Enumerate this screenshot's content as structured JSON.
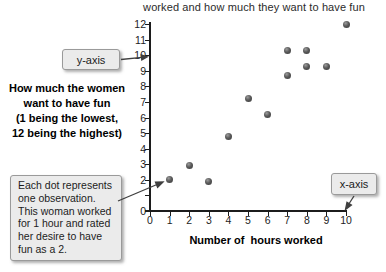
{
  "figure": {
    "title_line": "worked and how much they want to have fun",
    "y_axis_label_lines": [
      "How much the women",
      "want to have fun",
      "(1 being the lowest,",
      "12 being the highest)"
    ],
    "x_axis_label": "Number of  hours worked",
    "callout_y_axis": "y-axis",
    "callout_x_axis": "x-axis",
    "callout_observation": "Each dot represents\none observation.\nThis woman worked\nfor 1 hour and rated\nher desire to have\nfun as a 2."
  },
  "chart_data": {
    "type": "scatter",
    "title": "worked and how much they want to have fun",
    "xlabel": "Number of hours worked",
    "ylabel": "How much the women want to have fun (1 being the lowest, 12 being the highest)",
    "xlim": [
      0,
      10
    ],
    "ylim": [
      0,
      12
    ],
    "x_ticks": [
      0,
      1,
      2,
      3,
      4,
      5,
      6,
      7,
      8,
      9,
      10
    ],
    "y_ticks": [
      0,
      1,
      2,
      3,
      4,
      5,
      6,
      7,
      8,
      9,
      10,
      11,
      12
    ],
    "y_tick_labels_hidden": [
      1
    ],
    "grid": false,
    "legend": false,
    "points": [
      [
        1,
        2
      ],
      [
        2,
        2.9
      ],
      [
        3,
        1.9
      ],
      [
        4,
        4.8
      ],
      [
        5,
        7.2
      ],
      [
        6,
        6.2
      ],
      [
        7,
        8.7
      ],
      [
        7,
        10.3
      ],
      [
        8,
        9.3
      ],
      [
        8,
        10.3
      ],
      [
        9,
        9.3
      ],
      [
        10,
        12
      ]
    ],
    "annotations": [
      "y-axis",
      "x-axis",
      "Each dot represents one observation. This woman worked for 1 hour and rated her desire to have fun as a 2."
    ]
  },
  "colors": {
    "background": "#ffffff",
    "axis": "#1c1c1c",
    "dot": "#5a5a5a",
    "callout_fill": "#ebebeb",
    "callout_border": "#9a9a9a",
    "arrow": "#3f3f3f"
  }
}
